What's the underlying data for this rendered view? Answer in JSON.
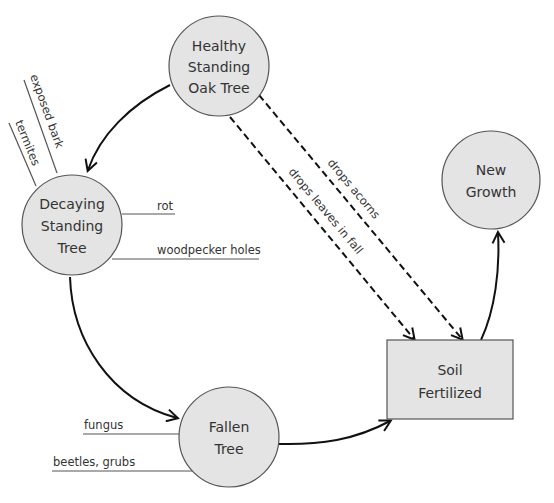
{
  "diagram": {
    "type": "cycle-diagram",
    "nodes": [
      {
        "id": "healthy",
        "shape": "circle",
        "lines": [
          "Healthy",
          "Standing",
          "Oak Tree"
        ]
      },
      {
        "id": "decaying",
        "shape": "circle",
        "lines": [
          "Decaying",
          "Standing",
          "Tree"
        ]
      },
      {
        "id": "fallen",
        "shape": "circle",
        "lines": [
          "Fallen",
          "Tree"
        ]
      },
      {
        "id": "soil",
        "shape": "rectangle",
        "lines": [
          "Soil",
          "Fertilized"
        ]
      },
      {
        "id": "growth",
        "shape": "circle",
        "lines": [
          "New",
          "Growth"
        ]
      }
    ],
    "edges": [
      {
        "from": "healthy",
        "to": "decaying",
        "style": "solid",
        "label": ""
      },
      {
        "from": "decaying",
        "to": "fallen",
        "style": "solid",
        "label": ""
      },
      {
        "from": "fallen",
        "to": "soil",
        "style": "solid",
        "label": ""
      },
      {
        "from": "soil",
        "to": "growth",
        "style": "solid",
        "label": ""
      },
      {
        "from": "healthy",
        "to": "soil",
        "style": "dashed",
        "label": "drops acorns"
      },
      {
        "from": "healthy",
        "to": "soil",
        "style": "dashed",
        "label": "drops leaves in fall"
      }
    ],
    "annotations": {
      "decaying": [
        "exposed bark",
        "termites",
        "rot",
        "woodpecker holes"
      ],
      "fallen": [
        "fungus",
        "beetles, grubs"
      ]
    },
    "colors": {
      "node_fill": "#e4e4e4",
      "node_stroke": "#555555",
      "arrow": "#111111",
      "background": "#ffffff"
    }
  }
}
